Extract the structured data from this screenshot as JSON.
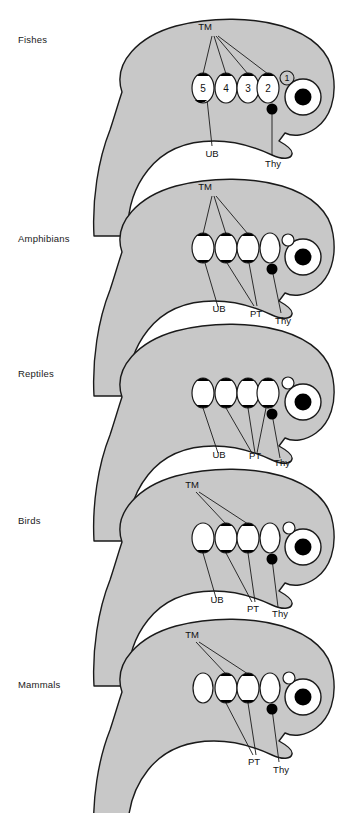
{
  "figure": {
    "colors": {
      "body_fill": "#c8c8c8",
      "outline": "#1a1a1a",
      "pouch_dark": "#000000",
      "pouch_light": "#ffffff",
      "label_text": "#111111"
    },
    "legend_keys": {
      "TM": "Thymus",
      "UB": "Ultimobranchial body",
      "PT": "Parathyroid",
      "Thy": "Thyroid"
    }
  },
  "panels": [
    {
      "id": "fishes",
      "label": "Fishes",
      "label_x": 18,
      "label_y": 41,
      "origin_y": 0,
      "pouch_numbers": [
        "5",
        "4",
        "3",
        "2"
      ],
      "circled_number": "1",
      "leader_labels": [
        {
          "name": "TM",
          "text": "TM",
          "x": 205,
          "y": 27
        },
        {
          "name": "UB",
          "text": "UB",
          "x": 202,
          "y": 152
        },
        {
          "name": "Thy",
          "text": "Thy",
          "x": 267,
          "y": 163
        }
      ],
      "pouches": [
        {
          "n": "5",
          "fill": "top-bottom",
          "label": "5"
        },
        {
          "n": "4",
          "fill": "top",
          "label": "4"
        },
        {
          "n": "3",
          "fill": "top",
          "label": "3"
        },
        {
          "n": "2",
          "fill": "top",
          "label": "2"
        }
      ],
      "has_large_oval": false,
      "has_small_circle": false
    },
    {
      "id": "amphibians",
      "label": "Amphibians",
      "label_x": 18,
      "label_y": 240,
      "origin_y": 160,
      "pouch_numbers": [],
      "circled_number": "",
      "leader_labels": [
        {
          "name": "TM",
          "text": "TM",
          "x": 205,
          "y": 187
        },
        {
          "name": "UB",
          "text": "UB",
          "x": 215,
          "y": 305
        },
        {
          "name": "PT",
          "text": "PT",
          "x": 254,
          "y": 311
        },
        {
          "name": "Thy",
          "text": "Thy",
          "x": 281,
          "y": 318
        }
      ],
      "pouches": [
        {
          "n": "5",
          "fill": "top-bottom",
          "label": ""
        },
        {
          "n": "4",
          "fill": "top-bottom",
          "label": ""
        },
        {
          "n": "3",
          "fill": "top-bottom",
          "label": ""
        }
      ],
      "has_large_oval": true,
      "has_small_circle": true
    },
    {
      "id": "reptiles",
      "label": "Reptiles",
      "label_x": 18,
      "label_y": 375,
      "origin_y": 305,
      "leader_labels": [
        {
          "name": "UB",
          "text": "UB",
          "x": 218,
          "y": 457
        },
        {
          "name": "PT",
          "text": "PT",
          "x": 252,
          "y": 458
        },
        {
          "name": "Thy",
          "text": "Thy",
          "x": 279,
          "y": 465
        }
      ],
      "pouches": [
        {
          "n": "5",
          "fill": "top-bottom",
          "label": ""
        },
        {
          "n": "4",
          "fill": "top-bottom",
          "label": ""
        },
        {
          "n": "3",
          "fill": "top-bottom",
          "label": ""
        },
        {
          "n": "2",
          "fill": "top-bottom",
          "label": ""
        }
      ],
      "has_large_oval": false,
      "has_small_circle": true
    },
    {
      "id": "birds",
      "label": "Birds",
      "label_x": 18,
      "label_y": 522,
      "origin_y": 450,
      "leader_labels": [
        {
          "name": "TM",
          "text": "TM",
          "x": 190,
          "y": 485
        },
        {
          "name": "UB",
          "text": "UB",
          "x": 213,
          "y": 600
        },
        {
          "name": "PT",
          "text": "PT",
          "x": 250,
          "y": 609
        },
        {
          "name": "Thy",
          "text": "Thy",
          "x": 276,
          "y": 614
        }
      ],
      "pouches": [
        {
          "n": "5",
          "fill": "bottom",
          "label": ""
        },
        {
          "n": "4",
          "fill": "top-bottom",
          "label": ""
        },
        {
          "n": "3",
          "fill": "top-bottom",
          "label": ""
        }
      ],
      "has_large_oval": true,
      "has_small_circle": true
    },
    {
      "id": "mammals",
      "label": "Mammals",
      "label_x": 18,
      "label_y": 686,
      "origin_y": 600,
      "leader_labels": [
        {
          "name": "TM",
          "text": "TM",
          "x": 190,
          "y": 634
        },
        {
          "name": "PT",
          "text": "PT",
          "x": 251,
          "y": 761
        },
        {
          "name": "Thy",
          "text": "Thy",
          "x": 277,
          "y": 770
        }
      ],
      "pouches": [
        {
          "n": "4",
          "fill": "top-bottom",
          "label": ""
        },
        {
          "n": "3",
          "fill": "top-bottom",
          "label": ""
        }
      ],
      "has_leading_oval": true,
      "has_large_oval": true,
      "has_small_circle": true
    }
  ]
}
